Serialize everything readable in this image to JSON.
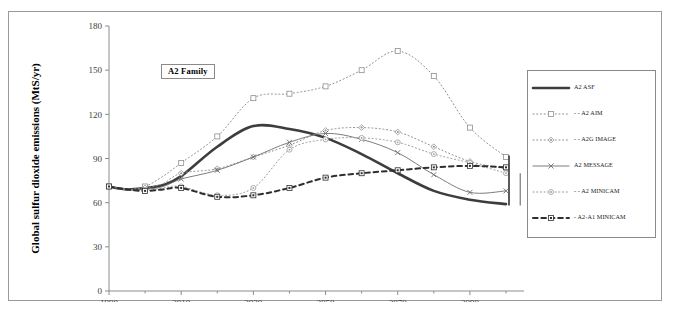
{
  "figure": {
    "annotation_label": "A2 Family",
    "caption_stub": ""
  },
  "chart_data": {
    "type": "line",
    "title": "A2 Family",
    "xlabel": "",
    "ylabel": "Global sulfur dioxide emissions (MtS/yr)",
    "xlim": [
      1990,
      2100
    ],
    "ylim": [
      0,
      180
    ],
    "ytick_values": [
      0,
      30,
      60,
      90,
      120,
      150,
      180
    ],
    "ytick_labels": [
      "0",
      "30",
      "60",
      "90",
      "120",
      "150",
      "180"
    ],
    "xtick_values": [
      1990,
      2010,
      2030,
      2050,
      2070,
      2090
    ],
    "xtick_labels": [
      "1990",
      "2010",
      "2030",
      "2050",
      "2070",
      "2090"
    ],
    "xminor_values": [
      2000,
      2020,
      2040,
      2060,
      2080,
      2100
    ],
    "grid": false,
    "legend_position": "right-outside",
    "x": [
      1990,
      1995,
      2000,
      2005,
      2010,
      2020,
      2030,
      2040,
      2050,
      2060,
      2070,
      2080,
      2090,
      2100
    ],
    "series": [
      {
        "name": "A2 ASF",
        "values": [
          71,
          69,
          70,
          72,
          78,
          98,
          112,
          110,
          104,
          93,
          80,
          68,
          62,
          59
        ],
        "color": "#3d3d3d",
        "linestyle": "solid",
        "linewidth": 2.6,
        "marker": "none"
      },
      {
        "name": "A2 AIM",
        "values": [
          71,
          69,
          71,
          78,
          87,
          105,
          131,
          134,
          139,
          150,
          163,
          146,
          111,
          91
        ],
        "color": "#8f8f8f",
        "linestyle": "dotted",
        "linewidth": 1.0,
        "marker": "square"
      },
      {
        "name": "A2G IMAGE",
        "values": [
          71,
          69,
          70,
          73,
          80,
          83,
          91,
          99,
          109,
          111,
          108,
          98,
          88,
          83
        ],
        "color": "#8f8f8f",
        "linestyle": "dotted",
        "linewidth": 1.0,
        "marker": "diamond-dot"
      },
      {
        "name": "A2 MESSAGE",
        "values": [
          71,
          69,
          69,
          71,
          76,
          82,
          91,
          101,
          107,
          103,
          94,
          79,
          67,
          68
        ],
        "color": "#6e6e6e",
        "linestyle": "solid",
        "linewidth": 0.9,
        "marker": "cross"
      },
      {
        "name": "A2 MINICAM",
        "values": [
          71,
          69,
          68,
          70,
          71,
          65,
          70,
          96,
          103,
          104,
          101,
          93,
          87,
          80
        ],
        "color": "#9a9a9a",
        "linestyle": "dotted",
        "linewidth": 1.0,
        "marker": "circle"
      },
      {
        "name": "A2-A1 MINICAM",
        "values": [
          71,
          69,
          68,
          69,
          70,
          64,
          65,
          70,
          77,
          80,
          82,
          84,
          85,
          84
        ],
        "color": "#2f2f2f",
        "linestyle": "dashed",
        "linewidth": 2.0,
        "marker": "square-dot"
      }
    ],
    "range_bracket": {
      "x": 2100,
      "low": 58,
      "high": 92
    },
    "range_bracket_secondary": {
      "x": 2102,
      "low": 58,
      "high": 80
    }
  },
  "legend": {
    "items": [
      {
        "label": "A2 ASF"
      },
      {
        "label": "- - A2 AIM"
      },
      {
        "label": "- - A2G IMAGE"
      },
      {
        "label": "A2 MESSAGE"
      },
      {
        "label": "- - A2 MINICAM"
      },
      {
        "label": "- A2-A1 MINICAM"
      }
    ]
  }
}
